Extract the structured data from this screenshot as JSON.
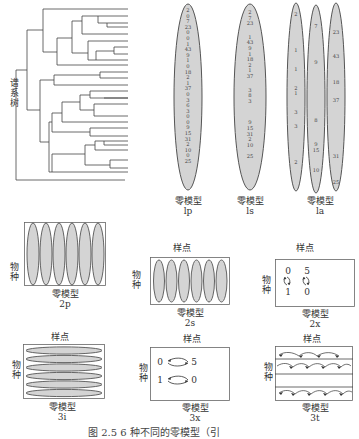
{
  "top": {
    "dendrogram_label": "谱系树",
    "panels": [
      {
        "id": "lp",
        "title": "零模型",
        "code": "lp",
        "numbers": [
          "2",
          "0",
          "7",
          "23",
          "0",
          "0",
          "1",
          "43",
          "9",
          "1",
          "0",
          "18",
          "2",
          "1",
          "37",
          "0",
          "3",
          "6",
          "3",
          "0",
          "0",
          "9",
          "15",
          "31",
          "2",
          "10",
          "0",
          "25"
        ]
      },
      {
        "id": "ls",
        "title": "零模型",
        "code": "ls",
        "numbers": [
          "2",
          "7",
          "23",
          "",
          "1",
          "43",
          "9",
          "1",
          "18",
          "2",
          "1",
          "37",
          "",
          "3",
          "8",
          "3",
          "",
          "9",
          "15",
          "31",
          "2",
          "10",
          "",
          "25"
        ]
      },
      {
        "id": "la",
        "title": "零模型",
        "code": "la",
        "columns": [
          [
            "2",
            "1",
            "1",
            "2",
            "1",
            "3",
            "3",
            "2"
          ],
          [
            "7",
            "9",
            "8",
            "9",
            "15",
            "10"
          ],
          [
            "23",
            "43",
            "18",
            "37",
            "31",
            "25"
          ]
        ]
      }
    ]
  },
  "bottom": {
    "panels": [
      {
        "id": "2p",
        "title": "零模型",
        "code": "2p",
        "top_label": "",
        "side_label": "物种",
        "ellipses": 6,
        "orientation": "vertical"
      },
      {
        "id": "2s",
        "title": "零模型",
        "code": "2s",
        "top_label": "样点",
        "side_label": "物种",
        "ellipses": 6,
        "orientation": "vertical"
      },
      {
        "id": "2x",
        "title": "零模型",
        "code": "2x",
        "top_label": "样点",
        "side_label": "物种",
        "swap": {
          "top": [
            "0",
            "5"
          ],
          "bottom": [
            "1",
            "0"
          ]
        }
      },
      {
        "id": "3i",
        "title": "零模型",
        "code": "3i",
        "top_label": "样点",
        "side_label": "物种",
        "ellipses": 6,
        "orientation": "horizontal"
      },
      {
        "id": "3x",
        "title": "零模型",
        "code": "3x",
        "top_label": "样点",
        "side_label": "物种",
        "swap": {
          "row1": [
            "0",
            "5"
          ],
          "row2": [
            "1",
            "0"
          ]
        }
      },
      {
        "id": "3t",
        "title": "零模型",
        "code": "3t",
        "top_label": "样点",
        "side_label": "物种",
        "rows": 3
      }
    ]
  },
  "caption": "图 2.5   6 种不同的零模型（引",
  "colors": {
    "ellipse_fill": "#d4d4d4",
    "ellipse_stroke": "#555555",
    "line": "#444444"
  }
}
